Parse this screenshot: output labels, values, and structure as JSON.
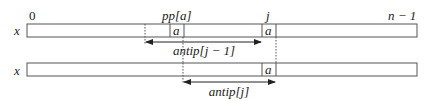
{
  "diagram": {
    "top_labels": {
      "start_index": "0",
      "pp_label": "pp[a]",
      "j_label": "j",
      "end_index": "n − 1"
    },
    "rows": [
      {
        "array_label": "x",
        "cells": [
          {
            "label": "a",
            "position": "pp[a]"
          },
          {
            "label": "a",
            "position": "j"
          }
        ],
        "span_label": "antip[j − 1]"
      },
      {
        "array_label": "x",
        "cells": [
          {
            "label": "a",
            "position": "j"
          }
        ],
        "span_label": "antip[j]"
      }
    ]
  }
}
